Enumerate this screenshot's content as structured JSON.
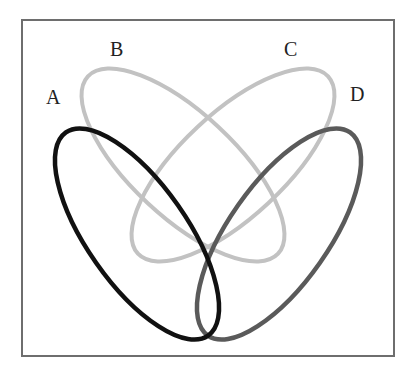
{
  "diagram": {
    "type": "venn-4-ellipse",
    "sets": [
      {
        "id": "A",
        "label": "A",
        "color": "#111111",
        "cx": 137,
        "cy": 234,
        "rx": 124,
        "ry": 50,
        "rotate": 55
      },
      {
        "id": "B",
        "label": "B",
        "color": "#c2c2c2",
        "cx": 183,
        "cy": 165,
        "rx": 130,
        "ry": 52,
        "rotate": 43
      },
      {
        "id": "C",
        "label": "C",
        "color": "#c2c2c2",
        "cx": 233,
        "cy": 165,
        "rx": 130,
        "ry": 52,
        "rotate": -43
      },
      {
        "id": "D",
        "label": "D",
        "color": "#5a5a5a",
        "cx": 279,
        "cy": 234,
        "rx": 124,
        "ry": 50,
        "rotate": -55
      }
    ],
    "labels": [
      {
        "text": "A",
        "x": 46,
        "y": 104
      },
      {
        "text": "B",
        "x": 110,
        "y": 56
      },
      {
        "text": "C",
        "x": 284,
        "y": 56
      },
      {
        "text": "D",
        "x": 350,
        "y": 101
      }
    ],
    "frame": {
      "x": 22,
      "y": 20,
      "width": 372,
      "height": 336,
      "color": "#6e6e6e"
    }
  }
}
